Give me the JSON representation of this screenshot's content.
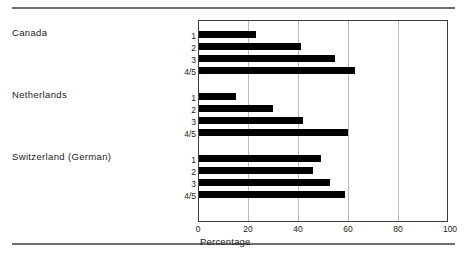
{
  "chart_data": {
    "type": "bar",
    "orientation": "horizontal",
    "title": "",
    "xlabel": "Percentage",
    "ylabel": "",
    "xlim": [
      0,
      100
    ],
    "xticks": [
      0,
      20,
      40,
      60,
      80,
      100
    ],
    "grid": true,
    "legend": "none",
    "groups": [
      {
        "name": "Canada",
        "categories": [
          "1",
          "2",
          "3",
          "4/5"
        ],
        "values": [
          23,
          41,
          55,
          63
        ]
      },
      {
        "name": "Netherlands",
        "categories": [
          "1",
          "2",
          "3",
          "4/5"
        ],
        "values": [
          15,
          30,
          42,
          60
        ]
      },
      {
        "name": "Switzerland (German)",
        "categories": [
          "1",
          "2",
          "3",
          "4/5"
        ],
        "values": [
          49,
          46,
          53,
          59
        ]
      }
    ]
  },
  "axis": {
    "tick_0": "0",
    "tick_20": "20",
    "tick_40": "40",
    "tick_60": "60",
    "tick_80": "80",
    "tick_100": "100",
    "title": "Percentage"
  },
  "groups": {
    "canada": {
      "label": "Canada",
      "sub_1": "1",
      "sub_2": "2",
      "sub_3": "3",
      "sub_4": "4/5"
    },
    "netherlands": {
      "label": "Netherlands",
      "sub_1": "1",
      "sub_2": "2",
      "sub_3": "3",
      "sub_4": "4/5"
    },
    "switzerland": {
      "label": "Switzerland (German)",
      "sub_1": "1",
      "sub_2": "2",
      "sub_3": "3",
      "sub_4": "4/5"
    }
  },
  "style": {
    "bar_color": "#000000",
    "grid_color": "#b9b9b9",
    "rule_color": "#6e6e6e",
    "axis_color": "#3c3c3c"
  }
}
